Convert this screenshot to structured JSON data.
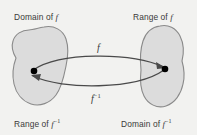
{
  "diagram": {
    "background_color": "#f2f2f0",
    "set_fill_color": "#dcdcdc",
    "set_stroke_color": "#8a8a8a",
    "arrow_color": "#4a4a4a",
    "point_color": "#000000",
    "text_color": "#3a3a3a",
    "labels": {
      "top_left": "Domain of ",
      "top_left_symbol": "f",
      "top_right": "Range of ",
      "top_right_symbol": "f",
      "bottom_left": "Range of ",
      "bottom_left_symbol": "f",
      "bottom_left_exponent": "−1",
      "bottom_right": "Domain of ",
      "bottom_right_symbol": "f",
      "bottom_right_exponent": "−1"
    },
    "arrows": [
      {
        "name": "forward-map",
        "label_symbol": "f",
        "label_exponent": "",
        "direction": "left-to-right",
        "description": "arrow from domain point to range point"
      },
      {
        "name": "inverse-map",
        "label_symbol": "f",
        "label_exponent": "−1",
        "direction": "right-to-left",
        "description": "arrow from range point back to domain point"
      }
    ],
    "sets": [
      {
        "name": "left-set",
        "role": "domain of f and range of f inverse"
      },
      {
        "name": "right-set",
        "role": "range of f and domain of f inverse"
      }
    ],
    "points": [
      {
        "name": "left-point",
        "set": "left-set"
      },
      {
        "name": "right-point",
        "set": "right-set"
      }
    ]
  }
}
